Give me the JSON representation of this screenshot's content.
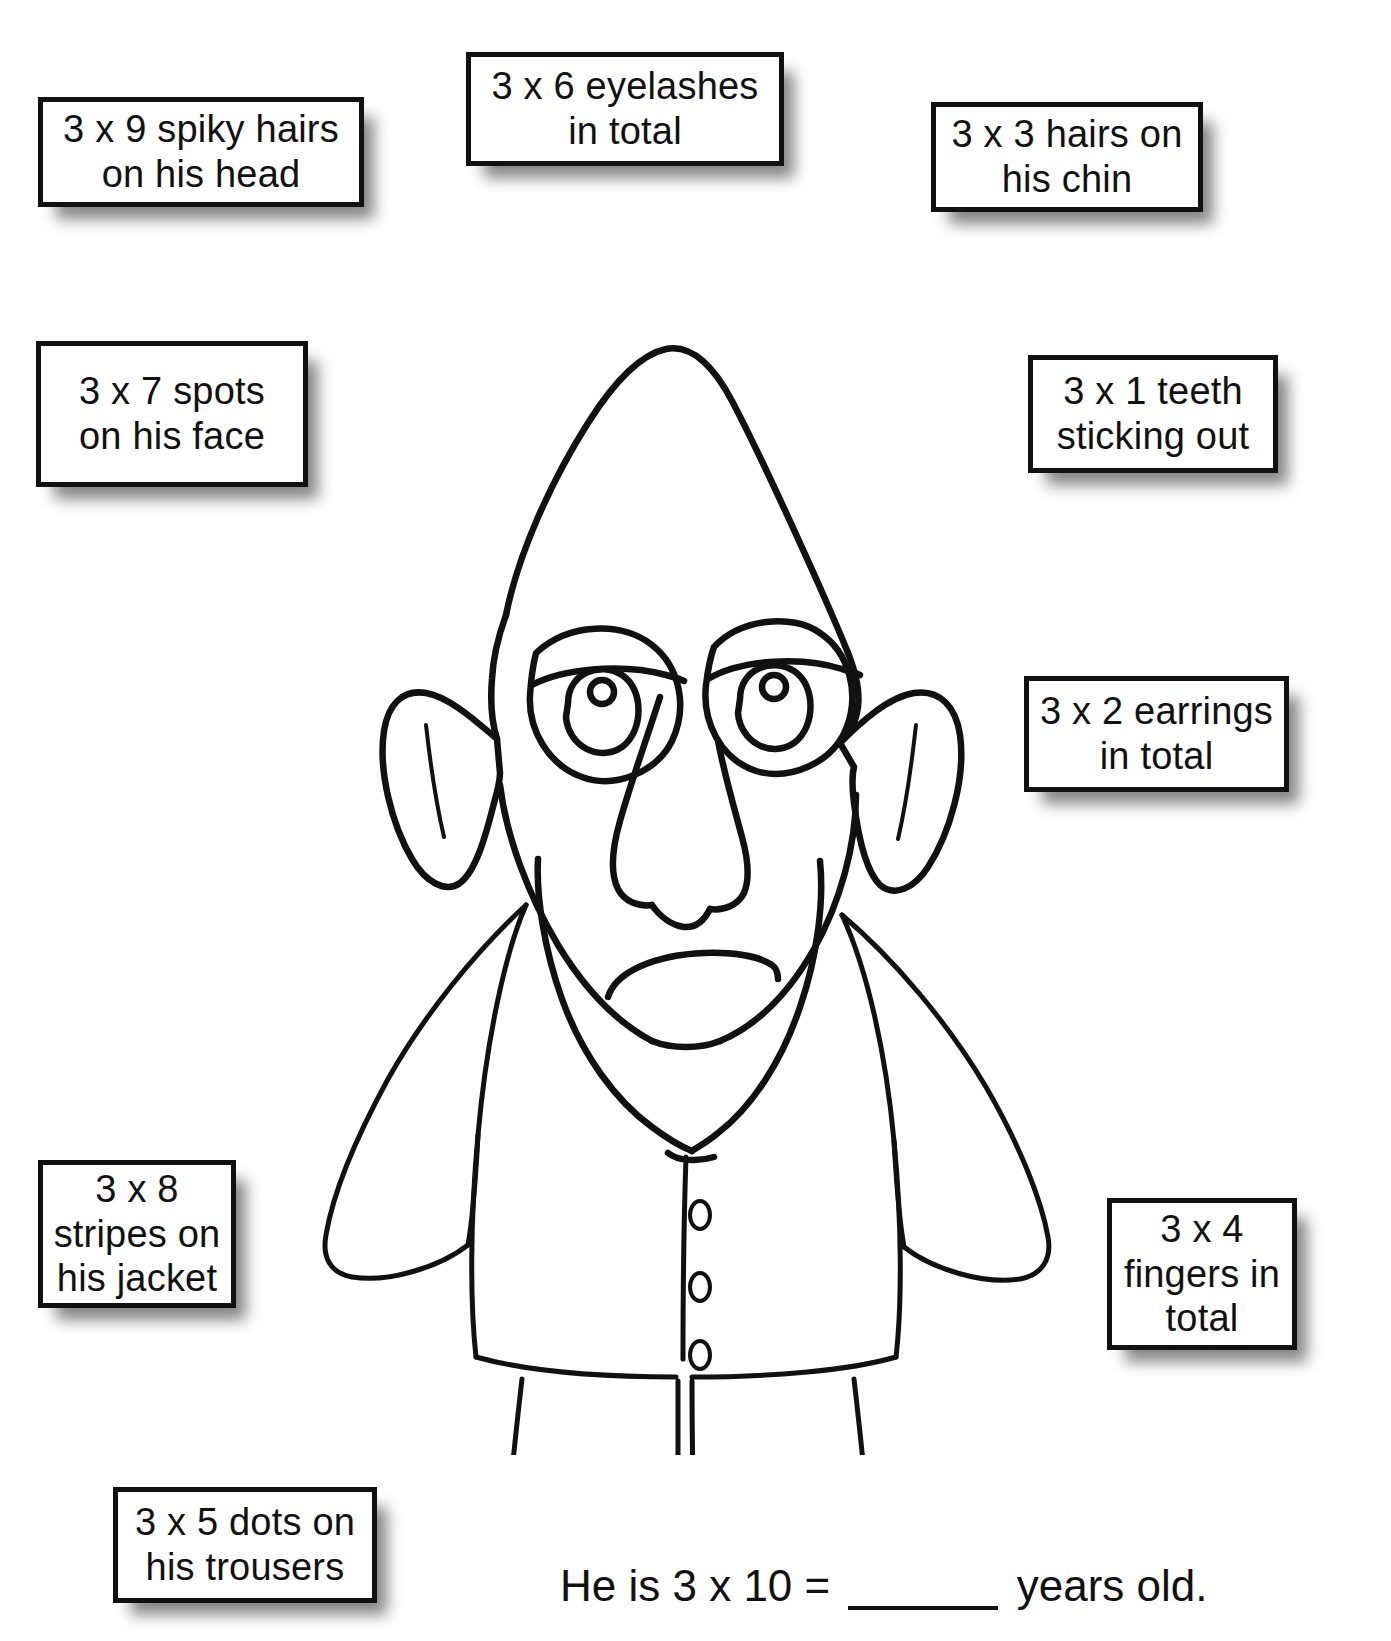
{
  "worksheet": {
    "background_color": "#ffffff",
    "ink_color": "#111111"
  },
  "labels": [
    {
      "id": "box-head",
      "name": "label-spiky-hairs",
      "text": "3 x 9 spiky hairs\non his head"
    },
    {
      "id": "box-eyelashes",
      "name": "label-eyelashes",
      "text": "3 x 6 eyelashes\nin total"
    },
    {
      "id": "box-chin",
      "name": "label-chin-hairs",
      "text": "3 x 3 hairs on\nhis chin"
    },
    {
      "id": "box-spots",
      "name": "label-face-spots",
      "text": "3 x 7 spots\non his face"
    },
    {
      "id": "box-teeth",
      "name": "label-teeth",
      "text": "3 x 1 teeth\nsticking out"
    },
    {
      "id": "box-earrings",
      "name": "label-earrings",
      "text": "3 x 2 earrings\nin total"
    },
    {
      "id": "box-stripes",
      "name": "label-jacket-stripes",
      "text": "3 x 8\nstripes on\nhis jacket"
    },
    {
      "id": "box-fingers",
      "name": "label-fingers",
      "text": "3 x 4\nfingers in\ntotal"
    },
    {
      "id": "box-trousers",
      "name": "label-trouser-dots",
      "text": "3 x 5 dots on\nhis trousers"
    }
  ],
  "label_text": {
    "spiky_hairs": "3 x 9 spiky hairs\non his head",
    "eyelashes": "3 x 6 eyelashes\nin total",
    "chin_hairs": "3 x 3 hairs on\nhis chin",
    "face_spots": "3 x 7 spots\non his face",
    "teeth": "3 x 1 teeth\nsticking out",
    "earrings": "3 x 2 earrings\nin total",
    "jacket_stripes": "3 x 8\nstripes on\nhis jacket",
    "fingers": "3 x 4\nfingers in\ntotal",
    "trouser_dots": "3 x 5 dots on\nhis trousers"
  },
  "question": {
    "prefix": "He is 3 x 10 = ",
    "blank": "",
    "suffix": " years old."
  },
  "figure": {
    "name": "monster-line-drawing",
    "parts": [
      "head",
      "left-ear",
      "right-ear",
      "left-eye",
      "right-eye",
      "nose",
      "mouth",
      "jaw",
      "jacket",
      "collar",
      "left-sleeve",
      "right-sleeve",
      "button-placket",
      "buttons",
      "trousers",
      "left-foot",
      "right-foot"
    ],
    "button_count": 4
  }
}
